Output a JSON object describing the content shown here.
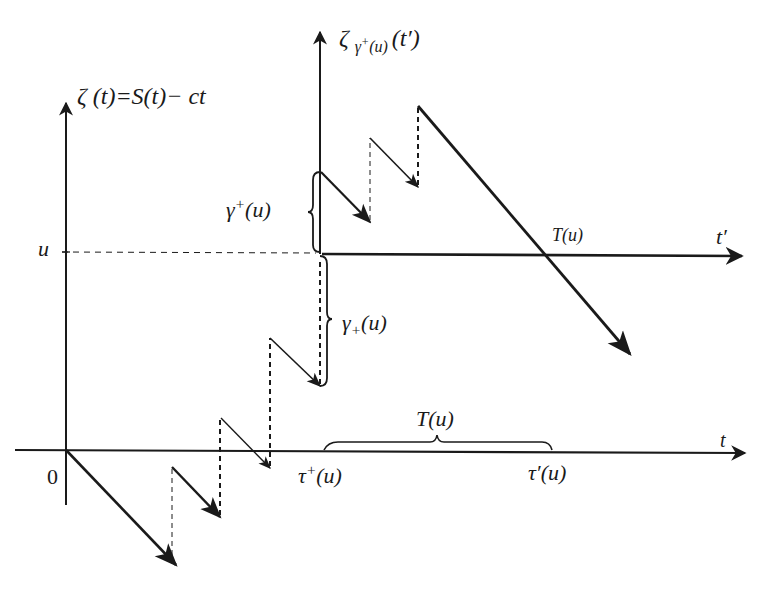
{
  "labels": {
    "zeta_main_sym": "ζ",
    "zeta_main_arg": "(t)",
    "zeta_main_eq": "=S",
    "zeta_main_arg2": "(t)",
    "zeta_main_tail": "− ct",
    "zeta_shift_sym": "ζ",
    "zeta_shift_sub": "γ",
    "zeta_shift_subsup": "+",
    "zeta_shift_subarg": "(u)",
    "zeta_shift_arg": "(t′)",
    "u_level": "u",
    "origin": "0",
    "t_axis": "t",
    "t_prime_axis": "t′",
    "gamma_upper_sym": "γ",
    "gamma_upper_sup": "+",
    "gamma_upper_arg": "(u)",
    "gamma_lower_sym": "γ",
    "gamma_lower_sub": "+",
    "gamma_lower_arg": "(u)",
    "T_on_tprime": "T",
    "T_on_tprime_arg": "(u)",
    "T_brace_sym": "T",
    "T_brace_arg": "(u)",
    "tau_plus_sym": "τ",
    "tau_plus_sup": "+",
    "tau_plus_arg": "(u)",
    "tau_prime_sym": "τ′",
    "tau_prime_arg": "(u)"
  },
  "colors": {
    "ink": "#1a1a1a",
    "background": "#ffffff"
  },
  "diagram": {
    "type": "risk-process-sample-path",
    "axes": [
      {
        "name": "t",
        "from": [
          15,
          450
        ],
        "to": [
          748,
          453
        ]
      },
      {
        "name": "zeta",
        "from": [
          66,
          565
        ],
        "to": [
          66,
          100
        ]
      },
      {
        "name": "t-prime",
        "from": [
          320,
          254
        ],
        "to": [
          745,
          256
        ]
      },
      {
        "name": "zeta-shifted",
        "from": [
          320,
          254
        ],
        "to": [
          320,
          30
        ]
      }
    ],
    "u_level_y": 252
  }
}
